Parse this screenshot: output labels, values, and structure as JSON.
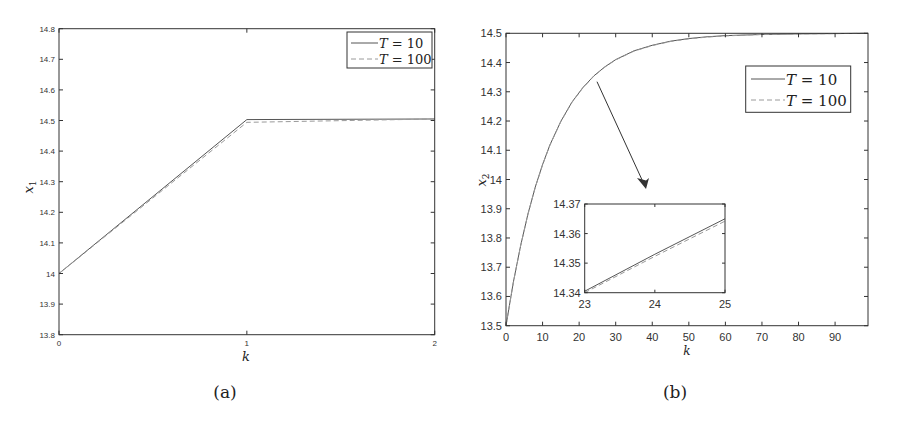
{
  "chart_data": [
    {
      "id": "a",
      "type": "line",
      "caption": "(a)",
      "title": "",
      "xlabel": "k",
      "ylabel": "x1",
      "xlim": [
        0,
        2
      ],
      "ylim": [
        13.8,
        14.8
      ],
      "xticks": [
        0,
        1,
        2
      ],
      "yticks": [
        13.8,
        13.9,
        14.0,
        14.1,
        14.2,
        14.3,
        14.4,
        14.5,
        14.6,
        14.7,
        14.8
      ],
      "ytick_labels": [
        "13.8",
        "13.9",
        "14",
        "14.1",
        "14.2",
        "14.3",
        "14.4",
        "14.5",
        "14.6",
        "14.7",
        "14.8"
      ],
      "grid": false,
      "legend_position": "upper right",
      "series": [
        {
          "name": "T = 10",
          "style": "solid",
          "x": [
            0,
            1,
            2
          ],
          "y": [
            14.0,
            14.503,
            14.505
          ]
        },
        {
          "name": "T = 100",
          "style": "dashed",
          "x": [
            0,
            1,
            2
          ],
          "y": [
            14.0,
            14.494,
            14.505
          ]
        }
      ]
    },
    {
      "id": "b",
      "type": "line",
      "caption": "(b)",
      "title": "",
      "xlabel": "k",
      "ylabel": "x2",
      "xlim": [
        0,
        99
      ],
      "ylim": [
        13.5,
        14.5
      ],
      "xticks": [
        0,
        10,
        20,
        30,
        40,
        50,
        60,
        70,
        80,
        90
      ],
      "yticks": [
        13.5,
        13.6,
        13.7,
        13.8,
        13.9,
        14.0,
        14.1,
        14.2,
        14.3,
        14.4,
        14.5
      ],
      "ytick_labels": [
        "13.5",
        "13.6",
        "13.7",
        "13.8",
        "13.9",
        "14",
        "14.1",
        "14.2",
        "14.3",
        "14.4",
        "14.5"
      ],
      "grid": false,
      "legend_position": "upper right",
      "series": [
        {
          "name": "T = 10",
          "style": "solid",
          "model": "14.5 - 1.0 * 0.923^k",
          "x": [
            0,
            2,
            4,
            6,
            8,
            10,
            12,
            15,
            18,
            21,
            24,
            27,
            30,
            35,
            40,
            45,
            50,
            55,
            60,
            70,
            80,
            90,
            99
          ],
          "y": [
            13.5,
            13.648,
            13.774,
            13.882,
            13.974,
            14.051,
            14.118,
            14.199,
            14.264,
            14.314,
            14.354,
            14.385,
            14.41,
            14.44,
            14.459,
            14.473,
            14.482,
            14.488,
            14.492,
            14.496,
            14.498,
            14.499,
            14.5
          ]
        },
        {
          "name": "T = 100",
          "style": "dashed",
          "x": [
            0,
            2,
            4,
            6,
            8,
            10,
            12,
            15,
            18,
            21,
            24,
            27,
            30,
            35,
            40,
            45,
            50,
            55,
            60,
            70,
            80,
            90,
            99
          ],
          "y": [
            13.5,
            13.647,
            13.773,
            13.881,
            13.973,
            14.05,
            14.117,
            14.198,
            14.263,
            14.313,
            14.353,
            14.384,
            14.409,
            14.439,
            14.458,
            14.472,
            14.481,
            14.487,
            14.491,
            14.496,
            14.498,
            14.499,
            14.5
          ]
        }
      ],
      "inset": {
        "xlim": [
          23,
          25
        ],
        "ylim": [
          14.34,
          14.37
        ],
        "xticks": [
          23,
          24,
          25
        ],
        "yticks": [
          14.34,
          14.35,
          14.36,
          14.37
        ],
        "ytick_labels": [
          "14.34",
          "14.35",
          "14.36",
          "14.37"
        ],
        "xlabel": "k",
        "series": [
          {
            "name": "T = 10",
            "style": "solid",
            "x": [
              23,
              24,
              25
            ],
            "y": [
              14.3405,
              14.353,
              14.365
            ]
          },
          {
            "name": "T = 100",
            "style": "dashed",
            "x": [
              23,
              24,
              25
            ],
            "y": [
              14.34,
              14.3523,
              14.3642
            ]
          }
        ]
      },
      "annotation": {
        "type": "arrow",
        "from_k_approx": 25,
        "points_to": "inset"
      }
    }
  ],
  "figure": {
    "panel_a": {
      "caption": "(a)",
      "xlabel": "k",
      "ylabel_base": "x",
      "ylabel_sub": "1",
      "legend": [
        {
          "label_var": "T",
          "label_eq": " = 10"
        },
        {
          "label_var": "T",
          "label_eq": " = 100"
        }
      ]
    },
    "panel_b": {
      "caption": "(b)",
      "xlabel": "k",
      "ylabel_base": "x",
      "ylabel_sub": "2",
      "legend": [
        {
          "label_var": "T",
          "label_eq": " = 10"
        },
        {
          "label_var": "T",
          "label_eq": " = 100"
        }
      ],
      "inset_xlabel": "k"
    },
    "colors": {
      "axis": "#333333",
      "line_solid": "#555555",
      "line_dashed": "#9a9a9a",
      "arrow": "#333333"
    }
  }
}
